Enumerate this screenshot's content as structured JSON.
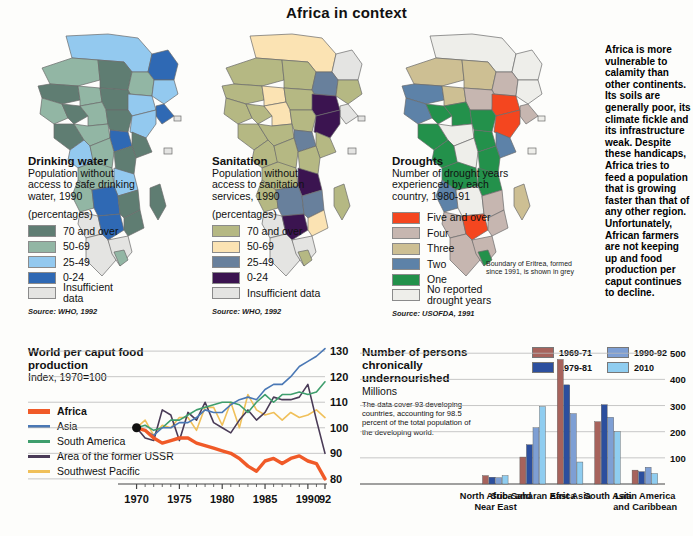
{
  "title": "Africa in context",
  "maps": [
    {
      "id": "drinking-water",
      "title": "Drinking water",
      "subtitle": "Population without access to safe drinking water, 1990",
      "units": "(percentages)",
      "legend": [
        {
          "label": "70 and over",
          "color": "#5f7d72"
        },
        {
          "label": "50-69",
          "color": "#92b6a4"
        },
        {
          "label": "25-49",
          "color": "#93c9ef"
        },
        {
          "label": "0-24",
          "color": "#2f69b4"
        },
        {
          "label": "Insufficient data",
          "color": "#e4e4e2"
        }
      ],
      "source": "Source: WHO, 1992"
    },
    {
      "id": "sanitation",
      "title": "Sanitation",
      "subtitle": "Population without access to sanitation services, 1990",
      "units": "(percentages)",
      "legend": [
        {
          "label": "70 and over",
          "color": "#b5b883"
        },
        {
          "label": "50-69",
          "color": "#fbe3b3"
        },
        {
          "label": "25-49",
          "color": "#68809c"
        },
        {
          "label": "0-24",
          "color": "#3b1450"
        },
        {
          "label": "Insufficient data",
          "color": "#e4e4e2"
        }
      ],
      "source": "Source: WHO, 1992"
    },
    {
      "id": "droughts",
      "title": "Droughts",
      "subtitle": "Number of drought years experienced by each country, 1980-91",
      "units": "",
      "legend": [
        {
          "label": "Five and over",
          "color": "#f4461f"
        },
        {
          "label": "Four",
          "color": "#c6b6b0"
        },
        {
          "label": "Three",
          "color": "#cdbf93"
        },
        {
          "label": "Two",
          "color": "#5d82a8"
        },
        {
          "label": "One",
          "color": "#23914b"
        },
        {
          "label": "No reported drought years",
          "color": "#eeeeea"
        }
      ],
      "note": "Boundary of Eritrea, formed since 1991, is shown in grey",
      "source": "Source: USOFDA, 1991"
    }
  ],
  "editorial": "Africa is more vulnerable to calamity than other continents. Its soils are generally poor, its climate fickle and its infrastructure weak. Despite these handicaps, Africa tries to feed a population that is growing faster than that of any other region. Unfortunately, African farmers are not keeping up and food production per caput continues to decline.",
  "chart_data": [
    {
      "type": "line",
      "id": "world-per-caput-food-production",
      "title": "World per caput food production",
      "subtitle": "Index, 1970=100",
      "xlabel": "",
      "ylabel": "",
      "xlim": [
        1969,
        1992
      ],
      "ylim": [
        78,
        132
      ],
      "grid": true,
      "legend_position": "left",
      "tick_labels_x": [
        "1970",
        "1975",
        "1980",
        "1985",
        "1990",
        "92"
      ],
      "tick_values_x": [
        1970,
        1975,
        1980,
        1985,
        1990,
        1992
      ],
      "tick_labels_y": [
        "80",
        "90",
        "100",
        "110",
        "120",
        "130"
      ],
      "tick_values_y": [
        80,
        90,
        100,
        110,
        120,
        130
      ],
      "x": [
        1970,
        1971,
        1972,
        1973,
        1974,
        1975,
        1976,
        1977,
        1978,
        1979,
        1980,
        1981,
        1982,
        1983,
        1984,
        1985,
        1986,
        1987,
        1988,
        1989,
        1990,
        1991,
        1992
      ],
      "series": [
        {
          "name": "Africa",
          "color": "#f05a28",
          "values": [
            100,
            99,
            96,
            94,
            95,
            96,
            96,
            94,
            93,
            92,
            91,
            90,
            88,
            85,
            83,
            87,
            88,
            86,
            88,
            89,
            87,
            86,
            80
          ]
        },
        {
          "name": "Asia",
          "color": "#4a78b5",
          "values": [
            100,
            99,
            97,
            100,
            100,
            102,
            102,
            104,
            107,
            106,
            106,
            109,
            111,
            112,
            111,
            115,
            117,
            117,
            120,
            124,
            126,
            128,
            131
          ]
        },
        {
          "name": "South America",
          "color": "#3f9e6d",
          "values": [
            100,
            101,
            99,
            100,
            103,
            103,
            105,
            107,
            108,
            109,
            110,
            110,
            109,
            106,
            110,
            113,
            110,
            113,
            113,
            114,
            113,
            114,
            118
          ]
        },
        {
          "name": "Area of the former USSR",
          "color": "#4a3b57",
          "values": [
            100,
            96,
            95,
            107,
            105,
            95,
            106,
            103,
            110,
            102,
            100,
            98,
            103,
            107,
            103,
            106,
            112,
            111,
            111,
            112,
            117,
            103,
            90
          ]
        },
        {
          "name": "Southwest Pacific",
          "color": "#f0c05a",
          "values": [
            100,
            103,
            97,
            101,
            100,
            104,
            104,
            99,
            108,
            108,
            101,
            110,
            100,
            113,
            107,
            105,
            106,
            103,
            106,
            104,
            105,
            107,
            104
          ]
        }
      ]
    },
    {
      "type": "bar",
      "id": "persons-chronically-undernourished",
      "title": "Number of persons chronically undernourished",
      "units": "Millions",
      "note": "The data cover 93 developing countries, accounting for 98.5 percent of the total population of the developing world.",
      "ylim": [
        0,
        520
      ],
      "tick_labels_y": [
        "100",
        "200",
        "300",
        "400",
        "500"
      ],
      "tick_values_y": [
        100,
        200,
        300,
        400,
        500
      ],
      "categories": [
        "North Africa and Near East",
        "Sub-Saharan Africa",
        "East Asia",
        "South Asia",
        "Latin America and Caribbean"
      ],
      "series": [
        {
          "name": "1969-71",
          "color": "#a7635c",
          "values": [
            32,
            103,
            476,
            238,
            53
          ]
        },
        {
          "name": "1979-81",
          "color": "#2c4f9e",
          "values": [
            26,
            150,
            379,
            303,
            47
          ]
        },
        {
          "name": "1990-92",
          "color": "#7e9fd4",
          "values": [
            24,
            215,
            269,
            255,
            64
          ]
        },
        {
          "name": "2010",
          "color": "#8fcdf0",
          "values": [
            32,
            296,
            84,
            200,
            40
          ]
        }
      ]
    }
  ]
}
